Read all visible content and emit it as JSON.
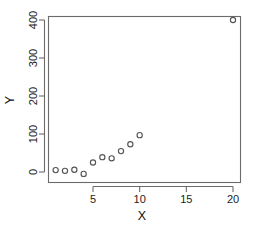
{
  "chart_data": {
    "type": "scatter",
    "title": "",
    "subtitle": "",
    "xlabel": "X",
    "ylabel": "Y",
    "x": [
      1,
      2,
      3,
      4,
      5,
      6,
      7,
      8,
      9,
      10,
      20
    ],
    "y": [
      5,
      3,
      6,
      -5,
      25,
      39,
      36,
      55,
      73,
      97,
      400
    ],
    "points": [
      {
        "x": 1,
        "y": 5
      },
      {
        "x": 2,
        "y": 3
      },
      {
        "x": 3,
        "y": 6
      },
      {
        "x": 4,
        "y": -5
      },
      {
        "x": 5,
        "y": 25
      },
      {
        "x": 6,
        "y": 39
      },
      {
        "x": 7,
        "y": 36
      },
      {
        "x": 8,
        "y": 55
      },
      {
        "x": 9,
        "y": 73
      },
      {
        "x": 10,
        "y": 97
      },
      {
        "x": 20,
        "y": 400
      }
    ],
    "marker": "open-circle",
    "marker_color": "#555555",
    "xlim": [
      0.3,
      20.7
    ],
    "ylim": [
      -25,
      415
    ],
    "xticks": [
      5,
      10,
      15,
      20
    ],
    "xtick_labels": [
      "5",
      "10",
      "15",
      "20"
    ],
    "yticks": [
      0,
      100,
      200,
      300,
      400
    ],
    "ytick_labels": [
      "0",
      "100",
      "200",
      "300",
      "400"
    ],
    "grid": false,
    "legend": false,
    "legend_position": "none",
    "frame": "box",
    "annotations": []
  },
  "axes": {
    "x_title": "X",
    "y_title": "Y"
  },
  "colors": {
    "background": "#ffffff",
    "axis": "#6b6b6b",
    "text": "#1c1c1c",
    "marker": "#555555"
  }
}
